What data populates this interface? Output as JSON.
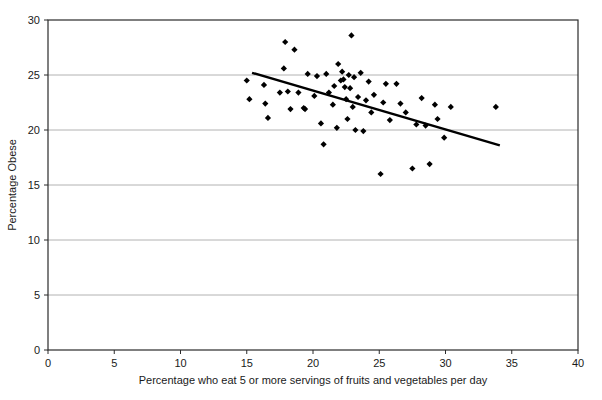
{
  "chart_data": {
    "type": "scatter",
    "title": "",
    "xlabel": "Percentage who eat 5 or more servings of fruits and vegetables per day",
    "ylabel": "Percentage Obese",
    "xlim": [
      0,
      40
    ],
    "ylim": [
      0,
      30
    ],
    "xticks": [
      0,
      5,
      10,
      15,
      20,
      25,
      30,
      35,
      40
    ],
    "yticks": [
      0,
      5,
      10,
      15,
      20,
      25,
      30
    ],
    "xtick_labels": [
      "0",
      "5",
      "10",
      "15",
      "20",
      "25",
      "30",
      "35",
      "40"
    ],
    "ytick_labels": [
      "0",
      "5",
      "10",
      "15",
      "20",
      "25",
      "30"
    ],
    "grid": "horizontal",
    "legend": "none",
    "marker": "diamond",
    "marker_color": "#000000",
    "series": [
      {
        "name": "States",
        "points": [
          [
            15.0,
            24.5
          ],
          [
            15.2,
            22.8
          ],
          [
            16.3,
            24.1
          ],
          [
            16.4,
            22.4
          ],
          [
            16.6,
            21.1
          ],
          [
            17.5,
            23.4
          ],
          [
            17.8,
            25.6
          ],
          [
            17.9,
            28.0
          ],
          [
            18.1,
            23.5
          ],
          [
            18.3,
            21.9
          ],
          [
            18.6,
            27.3
          ],
          [
            18.9,
            23.4
          ],
          [
            19.3,
            22.0
          ],
          [
            19.4,
            21.9
          ],
          [
            19.6,
            25.1
          ],
          [
            20.1,
            23.1
          ],
          [
            20.3,
            24.9
          ],
          [
            20.6,
            20.6
          ],
          [
            20.8,
            18.7
          ],
          [
            21.0,
            25.1
          ],
          [
            21.2,
            23.4
          ],
          [
            21.5,
            22.3
          ],
          [
            21.6,
            24.0
          ],
          [
            21.8,
            20.2
          ],
          [
            21.9,
            26.0
          ],
          [
            22.1,
            24.5
          ],
          [
            22.2,
            25.3
          ],
          [
            22.3,
            24.6
          ],
          [
            22.4,
            23.9
          ],
          [
            22.5,
            22.8
          ],
          [
            22.6,
            21.0
          ],
          [
            22.7,
            25.0
          ],
          [
            22.8,
            23.8
          ],
          [
            22.9,
            28.6
          ],
          [
            23.0,
            22.1
          ],
          [
            23.1,
            24.8
          ],
          [
            23.2,
            20.0
          ],
          [
            23.4,
            23.0
          ],
          [
            23.6,
            25.2
          ],
          [
            23.8,
            19.9
          ],
          [
            24.0,
            22.7
          ],
          [
            24.2,
            24.4
          ],
          [
            24.4,
            21.6
          ],
          [
            24.6,
            23.2
          ],
          [
            25.1,
            16.0
          ],
          [
            25.3,
            22.5
          ],
          [
            25.5,
            24.2
          ],
          [
            25.8,
            20.9
          ],
          [
            26.3,
            24.2
          ],
          [
            26.6,
            22.4
          ],
          [
            27.0,
            21.6
          ],
          [
            27.5,
            16.5
          ],
          [
            27.8,
            20.5
          ],
          [
            28.2,
            22.9
          ],
          [
            28.5,
            20.4
          ],
          [
            28.8,
            16.9
          ],
          [
            29.2,
            22.3
          ],
          [
            29.4,
            21.0
          ],
          [
            29.9,
            19.3
          ],
          [
            30.4,
            22.1
          ],
          [
            33.8,
            22.1
          ]
        ]
      }
    ],
    "trendline": {
      "name": "Linear fit",
      "x_start": 15.4,
      "y_start": 25.2,
      "x_end": 34.1,
      "y_end": 18.6,
      "color": "#000000"
    }
  },
  "axes": {
    "x_axis_name": "x-axis",
    "y_axis_name": "y-axis"
  }
}
